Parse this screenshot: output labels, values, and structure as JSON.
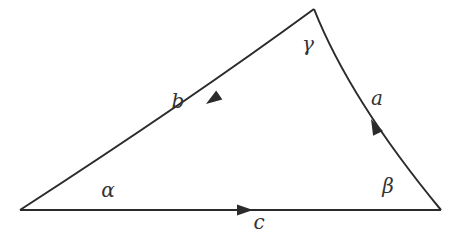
{
  "diagram": {
    "type": "curvilinear-triangle",
    "stroke_color": "#2b2b2b",
    "label_color": "#333333",
    "vertices": {
      "A": {
        "x": 20,
        "y": 210
      },
      "B": {
        "x": 441,
        "y": 210
      },
      "C": {
        "x": 314,
        "y": 9
      }
    },
    "sides": [
      {
        "name": "c",
        "label": "c",
        "from": "A",
        "to": "B",
        "arrow_direction": "toward B"
      },
      {
        "name": "a",
        "label": "a",
        "from": "B",
        "to": "C",
        "arrow_direction": "toward C"
      },
      {
        "name": "b",
        "label": "b",
        "from": "C",
        "to": "A",
        "arrow_direction": "toward A"
      }
    ],
    "angles": [
      {
        "vertex": "A",
        "label": "α"
      },
      {
        "vertex": "B",
        "label": "β"
      },
      {
        "vertex": "C",
        "label": "γ"
      }
    ]
  },
  "labels": {
    "side_a": "a",
    "side_b": "b",
    "side_c": "c",
    "angle_alpha": "α",
    "angle_beta": "β",
    "angle_gamma": "γ"
  }
}
